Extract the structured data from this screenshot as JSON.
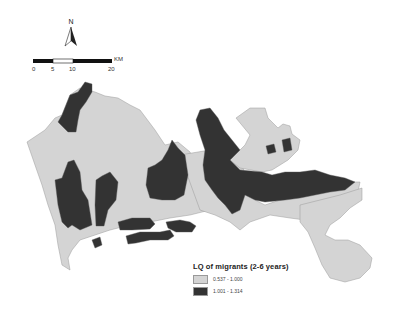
{
  "north_arrow": {
    "label": "N"
  },
  "scale_bar": {
    "unit": "KM",
    "ticks": [
      "0",
      "5",
      "10",
      "20"
    ]
  },
  "legend": {
    "title": "LQ of migrants (2-6 years)",
    "classes": [
      {
        "label": "0.537 - 1.000",
        "color": "#d4d4d4"
      },
      {
        "label": "1.001 - 1.314",
        "color": "#333333"
      }
    ]
  },
  "colors": {
    "low": "#d4d4d4",
    "high": "#333333",
    "border": "#9a9a9a",
    "background": "#ffffff"
  }
}
